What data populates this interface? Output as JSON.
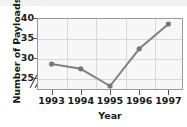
{
  "chart_data": {
    "type": "line",
    "title": "",
    "xlabel": "Year",
    "ylabel": "Number of Payloads",
    "categories": [
      "1993",
      "1994",
      "1995",
      "1996",
      "1997"
    ],
    "values": [
      28.5,
      27.3,
      23.0,
      32.3,
      38.5
    ],
    "series": [
      {
        "name": "Number of Payloads",
        "values": [
          28.5,
          27.3,
          23.0,
          32.3,
          38.5
        ]
      }
    ],
    "ylim": [
      22,
      40
    ],
    "yticks": [
      25,
      30,
      35,
      40
    ],
    "ytick_labels": [
      "25",
      "30",
      "35",
      "40"
    ],
    "xtick_labels": [
      "1993",
      "1994",
      "1995",
      "1996",
      "1997"
    ],
    "grid": true,
    "legend": "none",
    "axis_break": {
      "axis": "y",
      "symbol": "//",
      "below_value": 25
    },
    "marker": "circle",
    "colors": {
      "line": "#808080",
      "marker": "#777777",
      "plot_background": "#f7f7f7",
      "gridline": "#d8d8d8",
      "frame": "#9a9a9a",
      "text": "#1a1a1a"
    }
  }
}
